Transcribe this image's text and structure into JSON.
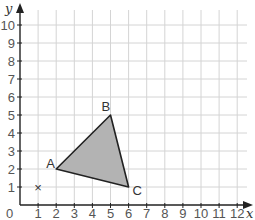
{
  "axes": {
    "x_label": "x",
    "y_label": "y",
    "origin_label": "0",
    "x_ticks": [
      "1",
      "2",
      "3",
      "4",
      "5",
      "6",
      "7",
      "8",
      "9",
      "10",
      "11",
      "12"
    ],
    "y_ticks": [
      "1",
      "2",
      "3",
      "4",
      "5",
      "6",
      "7",
      "8",
      "9",
      "10"
    ],
    "x_range": [
      0,
      12
    ],
    "y_range": [
      0,
      10
    ]
  },
  "triangle": {
    "vertices": [
      {
        "label": "A",
        "x": 2,
        "y": 2
      },
      {
        "label": "B",
        "x": 5,
        "y": 5
      },
      {
        "label": "C",
        "x": 6,
        "y": 1
      }
    ],
    "fill": "#b3b3b3",
    "stroke": "#222222"
  },
  "marker": {
    "symbol": "×",
    "x": 1,
    "y": 1
  },
  "colors": {
    "grid": "#d4d4d4",
    "axis": "#222222"
  }
}
